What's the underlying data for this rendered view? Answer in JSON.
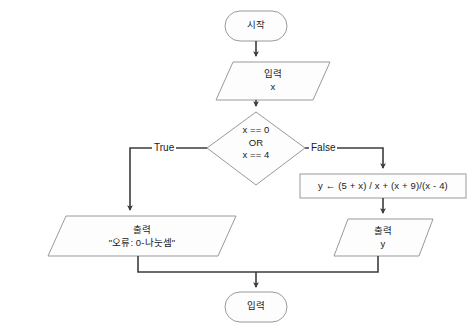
{
  "diagram": {
    "type": "flowchart",
    "colors": {
      "background": "#ffffff",
      "shape_fill": "#fdfdfd",
      "shape_stroke": "#9a9a9a",
      "connector_stroke": "#3c3c3c",
      "text": "#1a1a1a"
    }
  },
  "nodes": {
    "start": {
      "shape": "terminator",
      "label": "시작"
    },
    "input": {
      "shape": "parallelogram",
      "label_line1": "입력",
      "label_line2": "x"
    },
    "decision": {
      "shape": "diamond",
      "label_line1": "x == 0",
      "label_line2": "OR",
      "label_line3": "x == 4"
    },
    "process": {
      "shape": "rectangle",
      "label": "y ←  (5 + x) / x + (x + 9)/(x - 4)"
    },
    "output_error": {
      "shape": "parallelogram",
      "label_line1": "출력",
      "label_line2": "\"오류: 0-나눗셈\""
    },
    "output_result": {
      "shape": "parallelogram",
      "label_line1": "출력",
      "label_line2": "y"
    },
    "end": {
      "shape": "terminator",
      "label": "입력"
    }
  },
  "edges": {
    "true_label": "True",
    "false_label": "False"
  }
}
